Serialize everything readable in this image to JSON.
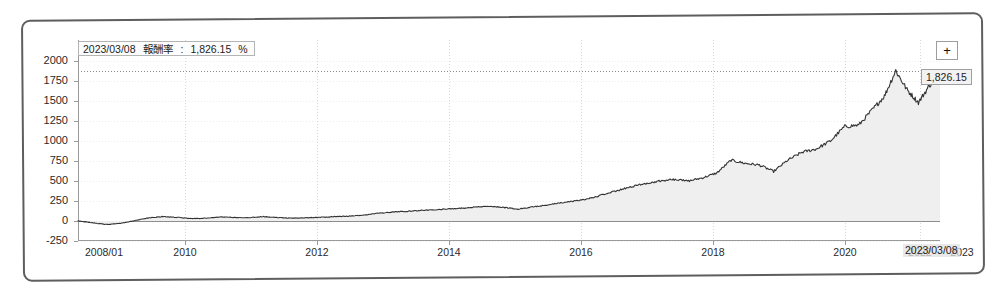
{
  "chart_data": {
    "type": "area",
    "title": "",
    "xlabel": "",
    "ylabel": "",
    "ylim": [
      -250,
      2000
    ],
    "grid": true,
    "legend_position": "none",
    "y_ticks": [
      "2000",
      "1750",
      "1500",
      "1250",
      "1000",
      "750",
      "500",
      "250",
      "0",
      "-250"
    ],
    "y_tick_values": [
      2000,
      1750,
      1500,
      1250,
      1000,
      750,
      500,
      250,
      0,
      -250
    ],
    "x_ticks": [
      "2008/01",
      "2010",
      "2012",
      "2014",
      "2016",
      "2018",
      "2020",
      "2022",
      "2023"
    ],
    "x_tick_values": [
      2008.0,
      2010.0,
      2012.0,
      2014.0,
      2016.0,
      2018.0,
      2020.0,
      2022.0,
      2023.18
    ],
    "series": [
      {
        "name": "報酬率",
        "unit": "%",
        "x": [
          2008.0,
          2008.25,
          2008.5,
          2008.75,
          2009.0,
          2009.25,
          2009.5,
          2009.75,
          2010.0,
          2010.25,
          2010.5,
          2010.75,
          2011.0,
          2011.25,
          2011.5,
          2011.75,
          2012.0,
          2012.25,
          2012.5,
          2012.75,
          2013.0,
          2013.25,
          2013.5,
          2013.75,
          2014.0,
          2014.25,
          2014.5,
          2014.75,
          2015.0,
          2015.25,
          2015.5,
          2015.75,
          2016.0,
          2016.25,
          2016.5,
          2016.75,
          2017.0,
          2017.25,
          2017.5,
          2017.75,
          2018.0,
          2018.25,
          2018.5,
          2018.75,
          2019.0,
          2019.25,
          2019.5,
          2019.75,
          2020.0,
          2020.25,
          2020.5,
          2020.75,
          2021.0,
          2021.25,
          2021.5,
          2021.75,
          2022.0,
          2022.2,
          2022.4,
          2022.6,
          2022.8,
          2023.0,
          2023.18
        ],
        "values": [
          0,
          -20,
          -45,
          -30,
          5,
          40,
          55,
          45,
          30,
          35,
          50,
          45,
          40,
          55,
          45,
          35,
          40,
          45,
          55,
          60,
          70,
          95,
          110,
          120,
          130,
          140,
          150,
          160,
          175,
          185,
          170,
          150,
          175,
          200,
          225,
          250,
          280,
          330,
          380,
          430,
          470,
          500,
          520,
          500,
          540,
          600,
          760,
          720,
          700,
          620,
          760,
          860,
          900,
          1000,
          1180,
          1200,
          1400,
          1560,
          1880,
          1640,
          1480,
          1700,
          1826.15
        ]
      }
    ],
    "reference_line": {
      "value": 1826.15,
      "style": "dotted"
    },
    "zero_line": {
      "value": 0,
      "style": "solid"
    },
    "last_point": {
      "date": "2023/03/08",
      "value": "1,826.15",
      "unit": "%"
    }
  },
  "tooltip": {
    "date": "2023/03/08",
    "metric_label": "報酬率",
    "separator": ":",
    "value": "1,826.15",
    "unit": "%"
  },
  "value_flag": {
    "label": "1,826.15"
  },
  "date_flag": {
    "label": "2023/03/08"
  },
  "controls": {
    "expand_label": "+",
    "expand_icon": "plus-icon"
  },
  "colors": {
    "line": "#333333",
    "fill": "#efefef",
    "axis": "#9a9a9a",
    "grid": "#d8d8d8",
    "text": "#2a2a2a",
    "frame": "#5e5e5e"
  }
}
